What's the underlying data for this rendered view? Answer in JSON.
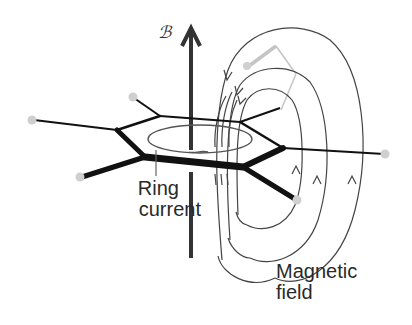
{
  "diagram": {
    "labels": {
      "field_symbol": "ℬ",
      "ring_current_line1": "Ring",
      "ring_current_line2": "current",
      "magnetic_field_line1": "Magnetic",
      "magnetic_field_line2": "field"
    },
    "elements": [
      {
        "name": "applied-field-arrow",
        "direction": "up"
      },
      {
        "name": "benzene-ring",
        "shape": "hexagon"
      },
      {
        "name": "induced-current-ellipse"
      },
      {
        "name": "induced-field-loops",
        "count": 3
      },
      {
        "name": "hydrogen-atoms",
        "count": 6
      }
    ],
    "colors": {
      "bonds": "#111111",
      "field_lines": "#444444",
      "hydrogen": "#cfcfcf",
      "faded": "#bdbdbd"
    }
  }
}
